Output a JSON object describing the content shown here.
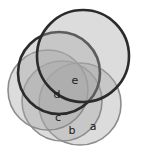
{
  "figure": {
    "background_color": "#ffffff",
    "width": 146,
    "height": 150
  },
  "palette": {
    "fill": "#a8a8a8",
    "fill_opacity": 0.4,
    "stroke_light": "#8c8c8c",
    "stroke_dark": "#2b2b2b",
    "label_color": "#1a1a1a"
  },
  "chart_data": {
    "type": "diagram",
    "subtype": "overlapping-circles",
    "labels": [
      "a",
      "b",
      "c",
      "d",
      "e"
    ],
    "grid": false,
    "legend": "none",
    "circles": [
      {
        "label": "a",
        "cx": 80,
        "cy": 104,
        "r": 41,
        "stroke": "light",
        "label_x": 93,
        "label_y": 127
      },
      {
        "label": "b",
        "cx": 62,
        "cy": 101,
        "r": 40,
        "stroke": "light",
        "label_x": 72,
        "label_y": 131
      },
      {
        "label": "c",
        "cx": 48,
        "cy": 90,
        "r": 40,
        "stroke": "light",
        "label_x": 58,
        "label_y": 118
      },
      {
        "label": "d",
        "cx": 59,
        "cy": 73,
        "r": 41,
        "stroke": "dark",
        "label_x": 57,
        "label_y": 95
      },
      {
        "label": "e",
        "cx": 83,
        "cy": 56,
        "r": 46,
        "stroke": "dark",
        "label_x": 75,
        "label_y": 81
      }
    ]
  }
}
